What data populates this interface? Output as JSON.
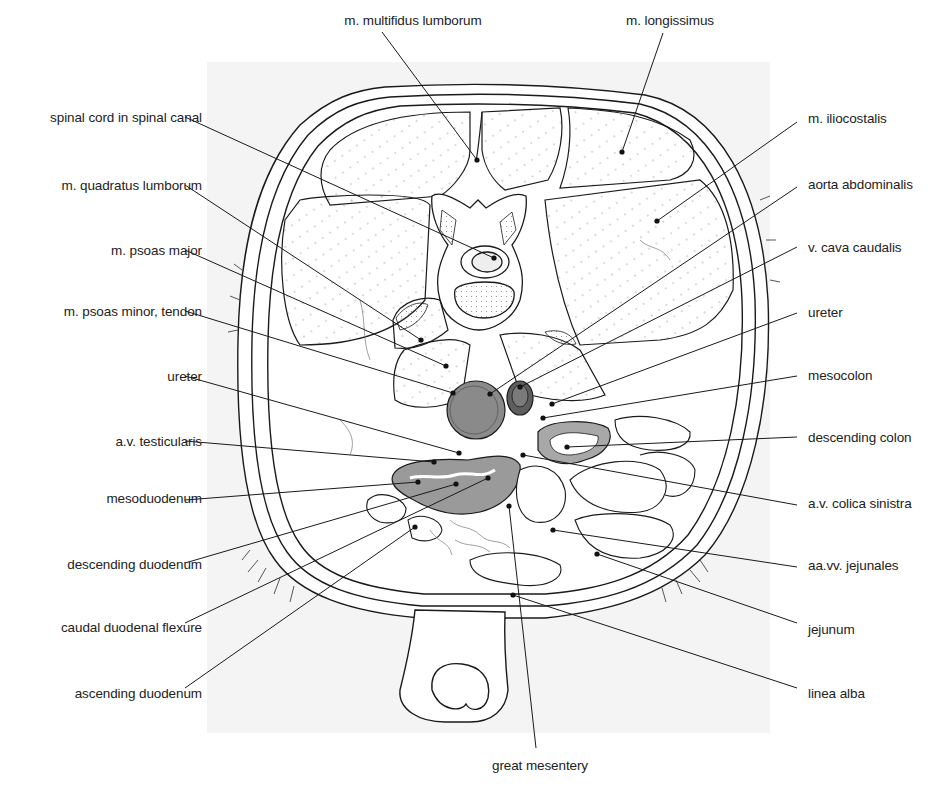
{
  "figure": {
    "panel": {
      "x": 207,
      "y": 62,
      "w": 563,
      "h": 671,
      "color": "#f4f4f4"
    },
    "colors": {
      "ink": "#1a1a1a",
      "fine_ink": "#777777",
      "aorta_fill": "#8a8a8a",
      "vena_cava_fill": "#5e5e5e",
      "duodenum_fill": "#9a9a9a",
      "colon_fill": "#a8a8a8",
      "muscle_fill": "#ffffff",
      "vertebra_body_fill": "#eeeeee"
    }
  },
  "labels": {
    "top": [
      {
        "id": "multifidus",
        "text": "m. multifidus lumborum",
        "x": 413,
        "y": 13,
        "line": [
          382,
          32,
          477,
          160
        ]
      },
      {
        "id": "longissimus",
        "text": "m. longissimus",
        "x": 670,
        "y": 13,
        "line": [
          663,
          33,
          622,
          152
        ]
      }
    ],
    "left": [
      {
        "id": "spinal-cord",
        "text": "spinal cord in spinal canal",
        "x": 202,
        "y": 110,
        "line": [
          185,
          117,
          494,
          258
        ]
      },
      {
        "id": "quadratus",
        "text": "m. quadratus lumborum",
        "x": 202,
        "y": 178,
        "line": [
          185,
          185,
          421,
          340
        ]
      },
      {
        "id": "psoas-major",
        "text": "m. psoas major",
        "x": 202,
        "y": 243,
        "line": [
          185,
          250,
          446,
          366
        ]
      },
      {
        "id": "psoas-minor",
        "text": "m. psoas minor, tendon",
        "x": 202,
        "y": 304,
        "line": [
          185,
          311,
          453,
          393
        ]
      },
      {
        "id": "ureter-left",
        "text": "ureter",
        "x": 202,
        "y": 369,
        "line": [
          185,
          376,
          459,
          453
        ]
      },
      {
        "id": "testicularis",
        "text": "a.v. testicularis",
        "x": 202,
        "y": 434,
        "line": [
          185,
          441,
          434,
          462
        ]
      },
      {
        "id": "mesoduodenum",
        "text": "mesoduodenum",
        "x": 202,
        "y": 491,
        "line": [
          185,
          500,
          418,
          482
        ]
      },
      {
        "id": "desc-duodenum",
        "text": "descending duodenum",
        "x": 202,
        "y": 557,
        "line": [
          185,
          563,
          456,
          484
        ]
      },
      {
        "id": "caudal-flexure",
        "text": "caudal duodenal flexure",
        "x": 202,
        "y": 620,
        "line": [
          185,
          623,
          488,
          478
        ]
      },
      {
        "id": "asc-duodenum",
        "text": "ascending duodenum",
        "x": 202,
        "y": 686,
        "line": [
          185,
          688,
          415,
          527
        ]
      }
    ],
    "right": [
      {
        "id": "iliocostalis",
        "text": "m. iliocostalis",
        "x": 808,
        "y": 111,
        "line": [
          797,
          122,
          657,
          221
        ]
      },
      {
        "id": "aorta",
        "text": "aorta abdominalis",
        "x": 808,
        "y": 177,
        "line": [
          797,
          187,
          490,
          394
        ]
      },
      {
        "id": "vena-cava",
        "text": "v. cava caudalis",
        "x": 808,
        "y": 240,
        "line": [
          797,
          247,
          520,
          387
        ]
      },
      {
        "id": "ureter-right",
        "text": "ureter",
        "x": 808,
        "y": 305,
        "line": [
          797,
          313,
          552,
          404
        ]
      },
      {
        "id": "mesocolon",
        "text": "mesocolon",
        "x": 808,
        "y": 368,
        "line": [
          797,
          376,
          543,
          418
        ]
      },
      {
        "id": "desc-colon",
        "text": "descending colon",
        "x": 808,
        "y": 430,
        "line": [
          797,
          437,
          567,
          447
        ]
      },
      {
        "id": "colica-sinistra",
        "text": "a.v. colica sinistra",
        "x": 808,
        "y": 496,
        "line": [
          797,
          505,
          523,
          455
        ]
      },
      {
        "id": "jejunales",
        "text": "aa.vv. jejunales",
        "x": 808,
        "y": 558,
        "line": [
          797,
          567,
          553,
          530
        ]
      },
      {
        "id": "jejunum",
        "text": "jejunum",
        "x": 808,
        "y": 622,
        "line": [
          797,
          623,
          597,
          554
        ]
      },
      {
        "id": "linea-alba",
        "text": "linea alba",
        "x": 808,
        "y": 686,
        "line": [
          797,
          688,
          513,
          595
        ]
      }
    ],
    "bottom": [
      {
        "id": "great-mesentery",
        "text": "great mesentery",
        "x": 540,
        "y": 758,
        "line": [
          536,
          748,
          509,
          506
        ]
      }
    ]
  }
}
